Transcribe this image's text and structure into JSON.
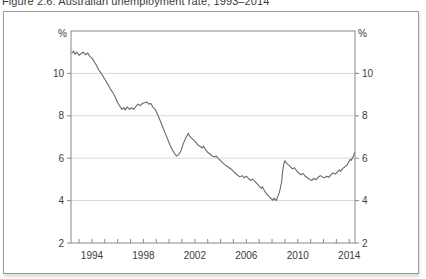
{
  "page": {
    "caption": "Figure 2.6: Australian unemployment rate, 1993–2014"
  },
  "colors": {
    "figure_border": "#9b9b9b",
    "axis": "#888888",
    "grid": "#d9d9d9",
    "line": "#696969",
    "text": "#3c3c3c"
  },
  "chart_data": {
    "type": "line",
    "title": "Figure 2.6: Australian unemployment rate, 1993–2014",
    "unit_label_left": "%",
    "unit_label_right": "%",
    "xlabel": "",
    "ylabel": "%",
    "x_tick_labels": [
      1994,
      1998,
      2002,
      2006,
      2010,
      2014
    ],
    "x_minor_tick_step": 1,
    "y_ticks": [
      2,
      4,
      6,
      8,
      10
    ],
    "xlim": [
      1992.37,
      2014.45
    ],
    "ylim": [
      2,
      12
    ],
    "grid": "horizontal",
    "legend": "none",
    "series": [
      {
        "name": "Australian unemployment rate (%)",
        "points": [
          [
            1992.42,
            10.95
          ],
          [
            1992.58,
            11.05
          ],
          [
            1992.67,
            10.9
          ],
          [
            1992.83,
            11.0
          ],
          [
            1993.0,
            10.85
          ],
          [
            1993.17,
            10.95
          ],
          [
            1993.33,
            11.0
          ],
          [
            1993.5,
            10.88
          ],
          [
            1993.67,
            10.96
          ],
          [
            1993.83,
            10.8
          ],
          [
            1994.0,
            10.72
          ],
          [
            1994.17,
            10.55
          ],
          [
            1994.33,
            10.4
          ],
          [
            1994.5,
            10.18
          ],
          [
            1994.67,
            10.05
          ],
          [
            1994.83,
            9.9
          ],
          [
            1995.0,
            9.72
          ],
          [
            1995.17,
            9.55
          ],
          [
            1995.33,
            9.38
          ],
          [
            1995.5,
            9.2
          ],
          [
            1995.67,
            9.05
          ],
          [
            1995.83,
            8.85
          ],
          [
            1996.0,
            8.62
          ],
          [
            1996.17,
            8.45
          ],
          [
            1996.33,
            8.3
          ],
          [
            1996.5,
            8.38
          ],
          [
            1996.58,
            8.28
          ],
          [
            1996.75,
            8.42
          ],
          [
            1996.92,
            8.3
          ],
          [
            1997.08,
            8.38
          ],
          [
            1997.25,
            8.3
          ],
          [
            1997.42,
            8.45
          ],
          [
            1997.58,
            8.55
          ],
          [
            1997.75,
            8.48
          ],
          [
            1997.92,
            8.58
          ],
          [
            1998.08,
            8.62
          ],
          [
            1998.25,
            8.65
          ],
          [
            1998.42,
            8.55
          ],
          [
            1998.58,
            8.58
          ],
          [
            1998.75,
            8.4
          ],
          [
            1998.92,
            8.3
          ],
          [
            1999.08,
            8.1
          ],
          [
            1999.25,
            7.85
          ],
          [
            1999.42,
            7.6
          ],
          [
            1999.58,
            7.35
          ],
          [
            1999.75,
            7.1
          ],
          [
            1999.92,
            6.85
          ],
          [
            2000.08,
            6.6
          ],
          [
            2000.25,
            6.4
          ],
          [
            2000.42,
            6.22
          ],
          [
            2000.58,
            6.1
          ],
          [
            2000.75,
            6.18
          ],
          [
            2000.92,
            6.35
          ],
          [
            2001.08,
            6.65
          ],
          [
            2001.25,
            6.9
          ],
          [
            2001.42,
            7.1
          ],
          [
            2001.5,
            7.18
          ],
          [
            2001.58,
            7.05
          ],
          [
            2001.75,
            6.95
          ],
          [
            2001.92,
            6.85
          ],
          [
            2002.08,
            6.75
          ],
          [
            2002.25,
            6.62
          ],
          [
            2002.42,
            6.55
          ],
          [
            2002.58,
            6.48
          ],
          [
            2002.67,
            6.58
          ],
          [
            2002.83,
            6.4
          ],
          [
            2003.0,
            6.28
          ],
          [
            2003.17,
            6.2
          ],
          [
            2003.33,
            6.12
          ],
          [
            2003.5,
            6.05
          ],
          [
            2003.67,
            6.1
          ],
          [
            2003.83,
            5.98
          ],
          [
            2004.0,
            5.88
          ],
          [
            2004.17,
            5.78
          ],
          [
            2004.33,
            5.7
          ],
          [
            2004.5,
            5.62
          ],
          [
            2004.67,
            5.55
          ],
          [
            2004.83,
            5.48
          ],
          [
            2005.0,
            5.38
          ],
          [
            2005.17,
            5.28
          ],
          [
            2005.33,
            5.2
          ],
          [
            2005.5,
            5.12
          ],
          [
            2005.67,
            5.18
          ],
          [
            2005.83,
            5.08
          ],
          [
            2006.0,
            5.15
          ],
          [
            2006.17,
            5.05
          ],
          [
            2006.33,
            4.95
          ],
          [
            2006.5,
            5.02
          ],
          [
            2006.67,
            4.9
          ],
          [
            2006.83,
            4.8
          ],
          [
            2007.0,
            4.68
          ],
          [
            2007.17,
            4.58
          ],
          [
            2007.25,
            4.65
          ],
          [
            2007.42,
            4.45
          ],
          [
            2007.58,
            4.32
          ],
          [
            2007.75,
            4.2
          ],
          [
            2007.92,
            4.1
          ],
          [
            2008.08,
            4.02
          ],
          [
            2008.17,
            4.12
          ],
          [
            2008.33,
            4.0
          ],
          [
            2008.42,
            4.15
          ],
          [
            2008.58,
            4.4
          ],
          [
            2008.75,
            4.9
          ],
          [
            2008.83,
            5.4
          ],
          [
            2008.92,
            5.75
          ],
          [
            2009.0,
            5.88
          ],
          [
            2009.08,
            5.8
          ],
          [
            2009.25,
            5.7
          ],
          [
            2009.42,
            5.6
          ],
          [
            2009.58,
            5.5
          ],
          [
            2009.75,
            5.55
          ],
          [
            2009.92,
            5.4
          ],
          [
            2010.08,
            5.3
          ],
          [
            2010.25,
            5.22
          ],
          [
            2010.42,
            5.28
          ],
          [
            2010.58,
            5.15
          ],
          [
            2010.75,
            5.08
          ],
          [
            2010.92,
            5.0
          ],
          [
            2011.08,
            4.95
          ],
          [
            2011.25,
            5.05
          ],
          [
            2011.42,
            4.98
          ],
          [
            2011.58,
            5.1
          ],
          [
            2011.75,
            5.18
          ],
          [
            2011.92,
            5.12
          ],
          [
            2012.08,
            5.08
          ],
          [
            2012.25,
            5.15
          ],
          [
            2012.42,
            5.1
          ],
          [
            2012.58,
            5.22
          ],
          [
            2012.75,
            5.3
          ],
          [
            2012.92,
            5.25
          ],
          [
            2013.08,
            5.35
          ],
          [
            2013.25,
            5.45
          ],
          [
            2013.33,
            5.38
          ],
          [
            2013.5,
            5.52
          ],
          [
            2013.67,
            5.6
          ],
          [
            2013.83,
            5.68
          ],
          [
            2013.92,
            5.78
          ],
          [
            2014.0,
            5.85
          ],
          [
            2014.08,
            5.95
          ],
          [
            2014.17,
            5.9
          ],
          [
            2014.25,
            6.02
          ],
          [
            2014.33,
            6.1
          ],
          [
            2014.42,
            6.28
          ]
        ]
      }
    ]
  }
}
